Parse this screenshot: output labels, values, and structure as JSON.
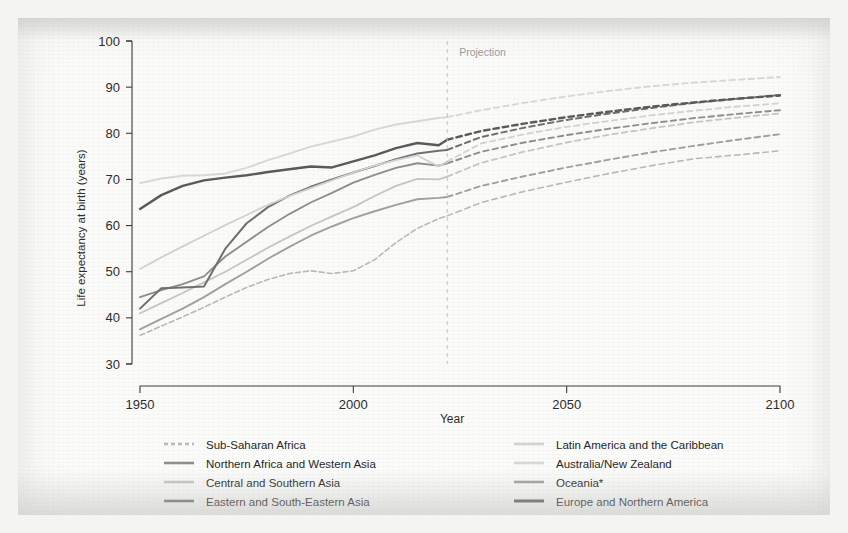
{
  "chart_data": {
    "type": "line",
    "title": "",
    "xlabel": "Year",
    "ylabel": "Life expectancy at birth (years)",
    "xlim": [
      1950,
      2100
    ],
    "ylim": [
      30,
      100
    ],
    "xticks": [
      1950,
      2000,
      2050,
      2100
    ],
    "yticks": [
      30,
      40,
      50,
      60,
      70,
      80,
      90,
      100
    ],
    "grid": false,
    "legend_position": "bottom",
    "annotations": [
      {
        "text": "Projection",
        "x": 2022,
        "type": "vertical-dashed-line-label"
      }
    ],
    "projection_start_year": 2022,
    "x": [
      1950,
      1955,
      1960,
      1965,
      1970,
      1975,
      1980,
      1985,
      1990,
      1995,
      2000,
      2005,
      2010,
      2015,
      2020,
      2022,
      2030,
      2040,
      2050,
      2060,
      2070,
      2080,
      2090,
      2100
    ],
    "series": [
      {
        "name": "Sub-Saharan Africa",
        "color": "#b9b9b9",
        "width": 1.6,
        "values": [
          36.2,
          38.2,
          40.2,
          42.3,
          44.5,
          46.6,
          48.3,
          49.6,
          50.2,
          49.6,
          50.2,
          52.6,
          56.3,
          59.4,
          61.5,
          62.1,
          65.0,
          67.4,
          69.4,
          71.3,
          73.0,
          74.5,
          75.3,
          76.2
        ]
      },
      {
        "name": "Northern Africa and Western Asia",
        "color": "#8e8e8e",
        "width": 1.9,
        "values": [
          44.5,
          46.0,
          47.3,
          49.0,
          53.3,
          56.5,
          59.7,
          62.5,
          65.0,
          67.1,
          69.3,
          71.0,
          72.5,
          73.5,
          73.0,
          73.5,
          76.0,
          78.0,
          79.6,
          81.0,
          82.2,
          83.3,
          84.2,
          85.0
        ]
      },
      {
        "name": "Central and Southern Asia",
        "color": "#c6c6c6",
        "width": 1.8,
        "values": [
          41.0,
          43.2,
          45.4,
          47.7,
          50.0,
          52.6,
          55.2,
          57.6,
          59.9,
          62.0,
          64.0,
          66.4,
          68.6,
          70.1,
          70.0,
          70.6,
          73.6,
          76.0,
          78.0,
          79.7,
          81.1,
          82.4,
          83.4,
          84.3
        ]
      },
      {
        "name": "Eastern and South-Eastern Asia",
        "color": "#6f6f6f",
        "width": 2.0,
        "values": [
          42.0,
          46.4,
          46.6,
          46.8,
          55.0,
          60.5,
          64.0,
          66.5,
          68.4,
          70.0,
          71.5,
          72.9,
          74.4,
          75.6,
          76.2,
          76.4,
          79.2,
          81.2,
          82.9,
          84.3,
          85.5,
          86.6,
          87.5,
          88.3
        ]
      },
      {
        "name": "Latin America and the Caribbean",
        "color": "#d2d2d2",
        "width": 1.8,
        "values": [
          50.6,
          53.1,
          55.5,
          57.8,
          60.1,
          62.3,
          64.5,
          66.4,
          68.1,
          69.8,
          71.5,
          73.0,
          74.2,
          75.2,
          72.8,
          73.9,
          77.8,
          79.8,
          81.4,
          82.7,
          83.9,
          84.9,
          85.8,
          86.5
        ]
      },
      {
        "name": "Australia/New Zealand",
        "color": "#d8d8d8",
        "width": 1.9,
        "values": [
          69.2,
          70.2,
          70.8,
          70.9,
          71.3,
          72.5,
          74.2,
          75.6,
          77.1,
          78.2,
          79.3,
          80.8,
          81.9,
          82.6,
          83.3,
          83.5,
          85.0,
          86.6,
          88.0,
          89.2,
          90.2,
          91.0,
          91.6,
          92.2
        ]
      },
      {
        "name": "Oceania*",
        "color": "#a0a0a0",
        "width": 1.9,
        "values": [
          37.5,
          39.8,
          42.0,
          44.5,
          47.3,
          50.0,
          52.8,
          55.4,
          57.8,
          59.8,
          61.6,
          63.1,
          64.5,
          65.7,
          66.0,
          66.2,
          68.6,
          70.7,
          72.6,
          74.3,
          75.9,
          77.3,
          78.6,
          79.8
        ]
      },
      {
        "name": "Europe and Northern America",
        "color": "#595959",
        "width": 2.4,
        "values": [
          63.6,
          66.6,
          68.6,
          69.8,
          70.4,
          70.9,
          71.6,
          72.2,
          72.8,
          72.6,
          73.9,
          75.2,
          76.8,
          77.9,
          77.4,
          78.6,
          80.5,
          82.1,
          83.5,
          84.7,
          85.8,
          86.7,
          87.5,
          88.2
        ]
      }
    ]
  },
  "legend": {
    "left_column": [
      {
        "label": "Sub-Saharan Africa",
        "color": "#b9b9b9",
        "dashed": true
      },
      {
        "label": "Northern Africa and Western Asia",
        "color": "#8e8e8e",
        "dashed": false
      },
      {
        "label": "Central and Southern Asia",
        "color": "#c6c6c6",
        "dashed": false
      },
      {
        "label": "Eastern and South-Eastern Asia",
        "color": "#6f6f6f",
        "dashed": false
      }
    ],
    "right_column": [
      {
        "label": "Latin America and the Caribbean",
        "color": "#d2d2d2",
        "dashed": false
      },
      {
        "label": "Australia/New Zealand",
        "color": "#d8d8d8",
        "dashed": false
      },
      {
        "label": "Oceania*",
        "color": "#a0a0a0",
        "dashed": false
      },
      {
        "label": "Europe and Northern America",
        "color": "#595959",
        "dashed": false
      }
    ]
  },
  "axis": {
    "y_title": "Life expectancy at birth (years)",
    "x_title": "Year",
    "y_tick_labels": [
      "100",
      "90",
      "80",
      "70",
      "60",
      "50",
      "40",
      "30"
    ],
    "x_tick_labels": [
      "1950",
      "2000",
      "2050",
      "2100"
    ]
  },
  "projection_label": "Projection",
  "colors": {
    "axis": "#3a3a3a",
    "text": "#1f1f1f",
    "projection_line": "#c0c0c0",
    "paper": "#fbfbfa"
  }
}
